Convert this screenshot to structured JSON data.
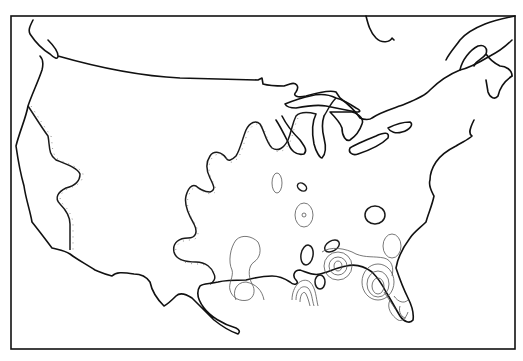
{
  "map": {
    "region": "Contiguous United States",
    "style": "black-and-white isoline map with hachured contours",
    "colors": {
      "background": "#ffffff",
      "outline": "#111111",
      "contour_bold": "#1a1a1a",
      "contour_thin": "#555555"
    },
    "features": [
      {
        "name": "national-outline",
        "kind": "coastline-and-border"
      },
      {
        "name": "great-lakes",
        "kind": "lake-shorelines"
      },
      {
        "name": "pacific-coast-contour",
        "kind": "hachured-contour"
      },
      {
        "name": "central-plains-contour",
        "kind": "hachured-contour"
      },
      {
        "name": "southeast-closed-contours",
        "kind": "closed-isolines"
      },
      {
        "name": "florida-contours",
        "kind": "nested-isolines"
      },
      {
        "name": "gulf-coast-contours",
        "kind": "nested-isolines"
      }
    ],
    "labels": []
  }
}
